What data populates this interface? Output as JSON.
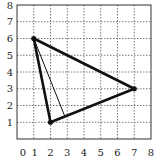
{
  "diagram": {
    "type": "coordinate-grid-triangle",
    "grid": {
      "xmin": 0,
      "xmax": 8,
      "ymin": 0,
      "ymax": 8,
      "line_style": "dotted"
    },
    "x_tick_labels": [
      "0",
      "1",
      "2",
      "3",
      "4",
      "5",
      "6",
      "7",
      "8"
    ],
    "y_tick_labels": [
      "1",
      "2",
      "3",
      "4",
      "5",
      "6",
      "7",
      "8"
    ],
    "vertices": [
      {
        "name": "A",
        "x": 1,
        "y": 6
      },
      {
        "name": "B",
        "x": 2,
        "y": 1
      },
      {
        "name": "C",
        "x": 7,
        "y": 3
      }
    ],
    "altitude": {
      "from": {
        "x": 1,
        "y": 6
      },
      "to": {
        "x": 2.86,
        "y": 1.34
      }
    },
    "colors": {
      "lines": "#111111",
      "grid": "#555555"
    }
  }
}
